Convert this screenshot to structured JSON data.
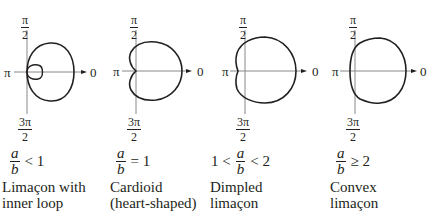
{
  "panels": [
    {
      "id": "inner-loop",
      "axis_labels": {
        "top_num": "π",
        "top_den": "2",
        "left": "π",
        "right": "0",
        "bottom_num": "3π",
        "bottom_den": "2"
      },
      "condition": {
        "prefix": "",
        "frac_num": "a",
        "frac_den": "b",
        "suffix": "< 1"
      },
      "name_line1": "Limaçon with",
      "name_line2": "inner loop",
      "ratio": 0.5
    },
    {
      "id": "cardioid",
      "axis_labels": {
        "top_num": "π",
        "top_den": "2",
        "left": "π",
        "right": "0",
        "bottom_num": "3π",
        "bottom_den": "2"
      },
      "condition": {
        "prefix": "",
        "frac_num": "a",
        "frac_den": "b",
        "suffix": "=  1"
      },
      "name_line1": "Cardioid",
      "name_line2": "(heart-shaped)",
      "ratio": 1
    },
    {
      "id": "dimpled",
      "axis_labels": {
        "top_num": "π",
        "top_den": "2",
        "left": "π",
        "right": "0",
        "bottom_num": "3π",
        "bottom_den": "2"
      },
      "condition": {
        "prefix": "1 <",
        "frac_num": "a",
        "frac_den": "b",
        "suffix": "< 2"
      },
      "name_line1": "Dimpled",
      "name_line2": "limaçon",
      "ratio": 1.5
    },
    {
      "id": "convex",
      "axis_labels": {
        "top_num": "π",
        "top_den": "2",
        "left": "π",
        "right": "0",
        "bottom_num": "3π",
        "bottom_den": "2"
      },
      "condition": {
        "prefix": "",
        "frac_num": "a",
        "frac_den": "b",
        "suffix": "≥ 2"
      },
      "name_line1": "Convex",
      "name_line2": "limaçon",
      "ratio": 2.5
    }
  ],
  "colors": {
    "curve": "#231f20",
    "axis": "#808080",
    "text": "#231f20",
    "background": "#ffffff"
  }
}
